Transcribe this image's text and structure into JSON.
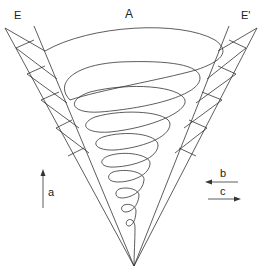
{
  "diagram": {
    "labels": {
      "top": "A",
      "left_wall": "E",
      "right_wall": "E'",
      "arrow_up": "a",
      "arrow_left": "b",
      "arrow_right": "c"
    },
    "colors": {
      "line": "#333333",
      "background": "#ffffff"
    }
  }
}
